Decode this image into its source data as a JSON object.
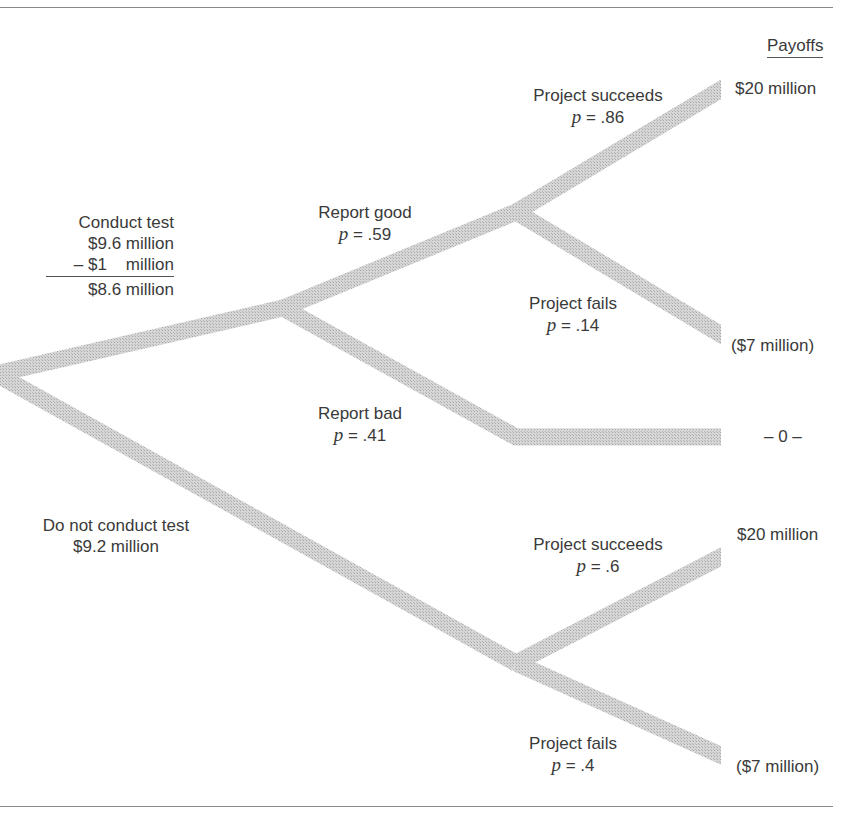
{
  "header": {
    "payoffs_label": "Payoffs"
  },
  "decisions": {
    "conduct_test": {
      "label": "Conduct test",
      "ev_line1": "$9.6 million",
      "cost_line": "– $1    million",
      "net_line": "$8.6 million"
    },
    "no_test": {
      "label": "Do not conduct test",
      "ev_line": "$9.2 million"
    }
  },
  "branches": {
    "report_good": {
      "label": "Report good",
      "p_label": "p",
      "p_value": "= .59"
    },
    "report_bad": {
      "label": "Report bad",
      "p_label": "p",
      "p_value": "= .41"
    },
    "good_succeeds": {
      "label": "Project succeeds",
      "p_label": "p",
      "p_value": "= .86"
    },
    "good_fails": {
      "label": "Project fails",
      "p_label": "p",
      "p_value": "= .14"
    },
    "notest_succeeds": {
      "label": "Project succeeds",
      "p_label": "p",
      "p_value": "= .6"
    },
    "notest_fails": {
      "label": "Project fails",
      "p_label": "p",
      "p_value": "= .4"
    }
  },
  "payoffs": {
    "good_succeeds": "$20 million",
    "good_fails": "($7 million)",
    "report_bad": "– 0 –",
    "notest_succeeds": "$20 million",
    "notest_fails": "($7 million)"
  },
  "colors": {
    "branch_fill": "#c9c9c9",
    "rule": "#8a8a8a",
    "text": "#3a3a3a"
  }
}
